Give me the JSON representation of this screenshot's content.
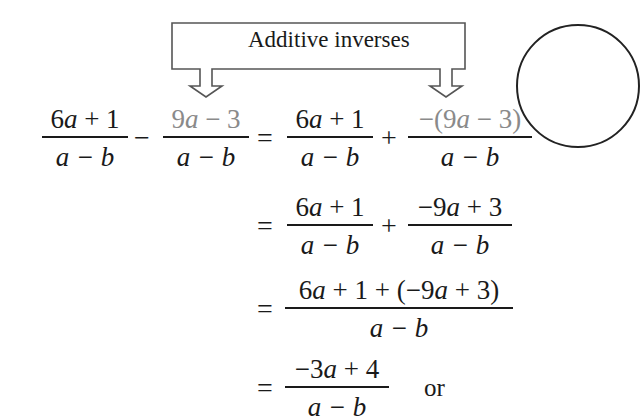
{
  "callout": {
    "label": "Additive inverses"
  },
  "steps": [
    {
      "lhs": {
        "frac1": {
          "num": "6a + 1",
          "den": "a − b"
        },
        "operator": "−",
        "frac2": {
          "num": "9a − 3",
          "den": "a − b",
          "num_color": "#8a8a8a"
        }
      },
      "equals": "=",
      "rhs": {
        "frac1": {
          "num": "6a + 1",
          "den": "a − b"
        },
        "operator": "+",
        "frac2": {
          "num": "−(9a − 3)",
          "den": "a − b",
          "num_color": "#8a8a8a"
        }
      }
    },
    {
      "equals": "=",
      "rhs": {
        "frac1": {
          "num": "6a + 1",
          "den": "a − b"
        },
        "operator": "+",
        "frac2": {
          "num": "−9a + 3",
          "den": "a − b"
        }
      }
    },
    {
      "equals": "=",
      "rhs": {
        "frac1": {
          "num": "6a + 1 + (−9a + 3)",
          "den": "a − b"
        }
      }
    },
    {
      "equals": "=",
      "rhs": {
        "frac1": {
          "num": "−3a + 4",
          "den": "a − b"
        }
      },
      "trailing": "or"
    }
  ],
  "colors": {
    "text": "#1a1a1a",
    "highlight_gray": "#8a8a8a",
    "background": "#ffffff"
  }
}
